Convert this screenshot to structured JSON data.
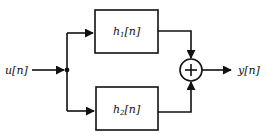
{
  "diagram": {
    "input": {
      "label": "u[n]"
    },
    "output": {
      "label": "y[n]"
    },
    "blocks": [
      {
        "name": "h",
        "subscript": "1",
        "arg": "[n]"
      },
      {
        "name": "h",
        "subscript": "2",
        "arg": "[n]"
      }
    ],
    "adder": {
      "symbol": "+"
    }
  }
}
